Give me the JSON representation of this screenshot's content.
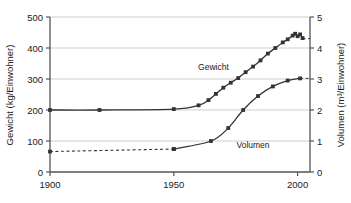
{
  "chart_data": {
    "type": "line",
    "title": "",
    "xlabel": "",
    "ylabel": "Gewicht (kg/Einwohner)",
    "y2label": "Volumen (m³/Einwohner)",
    "xlim": [
      1900,
      2005
    ],
    "ylim": [
      0,
      500
    ],
    "y2lim": [
      0,
      5
    ],
    "grid": true,
    "legend": "inline-labels",
    "xticks": [
      1900,
      1950,
      2000
    ],
    "xtick_labels": [
      "1900",
      "1950",
      "2000"
    ],
    "yticks": [
      0,
      100,
      200,
      300,
      400,
      500
    ],
    "ytick_labels": [
      "0",
      "100",
      "200",
      "300",
      "400",
      "500"
    ],
    "y2ticks": [
      0,
      1,
      2,
      3,
      4,
      5
    ],
    "y2tick_labels": [
      "0",
      "1",
      "2",
      "3",
      "4",
      "5"
    ],
    "series": [
      {
        "name": "Gewicht",
        "axis": "left",
        "units": "kg/Einwohner",
        "color": "#333333",
        "marker": "square",
        "points": [
          {
            "x": 1900,
            "y": 200
          },
          {
            "x": 1920,
            "y": 200
          },
          {
            "x": 1950,
            "y": 203
          },
          {
            "x": 1960,
            "y": 215
          },
          {
            "x": 1964,
            "y": 232
          },
          {
            "x": 1967,
            "y": 252
          },
          {
            "x": 1970,
            "y": 272
          },
          {
            "x": 1973,
            "y": 288
          },
          {
            "x": 1976,
            "y": 303
          },
          {
            "x": 1979,
            "y": 322
          },
          {
            "x": 1982,
            "y": 340
          },
          {
            "x": 1985,
            "y": 360
          },
          {
            "x": 1988,
            "y": 382
          },
          {
            "x": 1991,
            "y": 400
          },
          {
            "x": 1994,
            "y": 418
          },
          {
            "x": 1996,
            "y": 428
          },
          {
            "x": 1998,
            "y": 440
          },
          {
            "x": 1999,
            "y": 446
          },
          {
            "x": 2000,
            "y": 438
          },
          {
            "x": 2001,
            "y": 444
          },
          {
            "x": 2002,
            "y": 432
          }
        ],
        "dashed_end_value": 430
      },
      {
        "name": "Volumen",
        "axis": "right",
        "units": "m³/Einwohner",
        "color": "#333333",
        "marker": "square",
        "dashed_segment": [
          {
            "x": 1900,
            "y": 0.66
          },
          {
            "x": 1950,
            "y": 0.74
          }
        ],
        "points": [
          {
            "x": 1950,
            "y": 0.74
          },
          {
            "x": 1965,
            "y": 1.0
          },
          {
            "x": 1972,
            "y": 1.42
          },
          {
            "x": 1978,
            "y": 2.0
          },
          {
            "x": 1984,
            "y": 2.45
          },
          {
            "x": 1990,
            "y": 2.76
          },
          {
            "x": 1996,
            "y": 2.95
          },
          {
            "x": 2001,
            "y": 3.02
          }
        ],
        "dashed_end_value": 3.02
      }
    ],
    "annotations": [
      {
        "text": "Gewicht",
        "x": 1966,
        "y": 330
      },
      {
        "text": "Volumen",
        "x": 1982,
        "y": 78
      }
    ],
    "colors": {
      "axis": "#555555",
      "grid": "#cfcfcf",
      "line": "#333333",
      "text": "#1a1a1a",
      "background": "#ffffff"
    }
  }
}
